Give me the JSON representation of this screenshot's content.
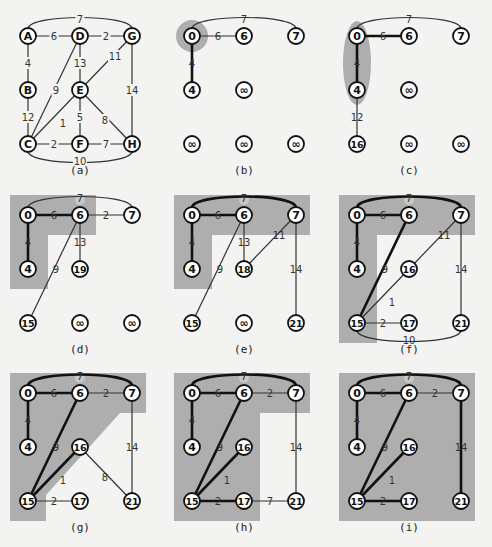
{
  "figure": {
    "background": "#f3f3f1",
    "shade_color": "#aeaeae",
    "edge_color": "#333333",
    "tree_edge_color": "#111111"
  },
  "chart_data": {
    "type": "graph",
    "source_node": "A",
    "nodes": [
      "A",
      "B",
      "C",
      "D",
      "E",
      "F",
      "G",
      "H"
    ],
    "edges": [
      {
        "u": "A",
        "v": "G",
        "w": 7
      },
      {
        "u": "A",
        "v": "D",
        "w": 6
      },
      {
        "u": "D",
        "v": "G",
        "w": 2
      },
      {
        "u": "A",
        "v": "B",
        "w": 4
      },
      {
        "u": "D",
        "v": "E",
        "w": 13
      },
      {
        "u": "G",
        "v": "E",
        "w": 11
      },
      {
        "u": "B",
        "v": "C",
        "w": 12
      },
      {
        "u": "D",
        "v": "C",
        "w": 9
      },
      {
        "u": "G",
        "v": "H",
        "w": 14
      },
      {
        "u": "E",
        "v": "C",
        "w": 1
      },
      {
        "u": "E",
        "v": "F",
        "w": 5
      },
      {
        "u": "E",
        "v": "H",
        "w": 8
      },
      {
        "u": "C",
        "v": "F",
        "w": 2
      },
      {
        "u": "F",
        "v": "H",
        "w": 7
      },
      {
        "u": "C",
        "v": "H",
        "w": 10
      }
    ],
    "panels": [
      {
        "label": "(a)",
        "type": "original",
        "dist": null
      },
      {
        "label": "(b)",
        "dist": {
          "A": "0",
          "B": "∞",
          "C": "∞",
          "D": "6",
          "E": "∞",
          "F": "∞",
          "G": "7",
          "H": "∞"
        }
      },
      {
        "label": "(c)",
        "dist": {
          "A": "0",
          "B": "4",
          "C": "16",
          "D": "6",
          "E": "∞",
          "F": "∞",
          "G": "7",
          "H": "∞"
        }
      },
      {
        "label": "(d)",
        "dist": {
          "A": "0",
          "B": "4",
          "C": "15",
          "D": "6",
          "E": "19",
          "F": "∞",
          "G": "7",
          "H": "∞"
        }
      },
      {
        "label": "(e)",
        "dist": {
          "A": "0",
          "B": "4",
          "C": "15",
          "D": "6",
          "E": "18",
          "F": "∞",
          "G": "7",
          "H": "21"
        }
      },
      {
        "label": "(f)",
        "dist": {
          "A": "0",
          "B": "4",
          "C": "15",
          "D": "6",
          "E": "16",
          "F": "17",
          "G": "7",
          "H": "21"
        }
      },
      {
        "label": "(g)",
        "dist": {
          "A": "0",
          "B": "4",
          "C": "15",
          "D": "6",
          "E": "16",
          "F": "17",
          "G": "7",
          "H": "21"
        }
      },
      {
        "label": "(h)",
        "dist": {
          "A": "0",
          "B": "4",
          "C": "15",
          "D": "6",
          "E": "16",
          "F": "17",
          "G": "7",
          "H": "21"
        }
      },
      {
        "label": "(i)",
        "dist": {
          "A": "0",
          "B": "4",
          "C": "15",
          "D": "6",
          "E": "16",
          "F": "17",
          "G": "7",
          "H": "21"
        }
      }
    ]
  },
  "panels": [
    {
      "label": "(a)",
      "nodes": {
        "A": "A",
        "B": "B",
        "C": "C",
        "D": "D",
        "E": "E",
        "F": "F",
        "G": "G",
        "H": "H"
      },
      "edges": [
        {
          "u": "A",
          "v": "G",
          "w": "7",
          "arc": "top",
          "style": "n"
        },
        {
          "u": "A",
          "v": "D",
          "w": "6",
          "style": "n"
        },
        {
          "u": "D",
          "v": "G",
          "w": "2",
          "style": "n"
        },
        {
          "u": "A",
          "v": "B",
          "w": "4",
          "style": "n"
        },
        {
          "u": "D",
          "v": "E",
          "w": "13",
          "style": "n"
        },
        {
          "u": "G",
          "v": "E",
          "w": "11",
          "style": "n"
        },
        {
          "u": "B",
          "v": "C",
          "w": "12",
          "style": "n"
        },
        {
          "u": "D",
          "v": "C",
          "w": "9",
          "style": "n"
        },
        {
          "u": "G",
          "v": "H",
          "w": "14",
          "style": "n"
        },
        {
          "u": "E",
          "v": "C",
          "w": "1",
          "style": "n"
        },
        {
          "u": "E",
          "v": "F",
          "w": "5",
          "style": "n"
        },
        {
          "u": "E",
          "v": "H",
          "w": "8",
          "style": "n"
        },
        {
          "u": "C",
          "v": "F",
          "w": "2",
          "style": "n"
        },
        {
          "u": "F",
          "v": "H",
          "w": "7",
          "style": "n"
        },
        {
          "u": "C",
          "v": "H",
          "w": "10",
          "arc": "bottom",
          "style": "n"
        }
      ],
      "shade": null
    },
    {
      "label": "(b)",
      "nodes": {
        "A": "0",
        "B": "4",
        "C": "∞",
        "D": "6",
        "E": "∞",
        "F": "∞",
        "G": "7",
        "H": "∞"
      },
      "edges": [
        {
          "u": "A",
          "v": "G",
          "w": "7",
          "arc": "top",
          "style": "n"
        },
        {
          "u": "A",
          "v": "D",
          "w": "6",
          "style": "n"
        },
        {
          "u": "A",
          "v": "B",
          "w": "4",
          "style": "b"
        }
      ],
      "shade": "circle"
    },
    {
      "label": "(c)",
      "nodes": {
        "A": "0",
        "B": "4",
        "C": "16",
        "D": "6",
        "E": "∞",
        "F": "∞",
        "G": "7",
        "H": "∞"
      },
      "edges": [
        {
          "u": "A",
          "v": "G",
          "w": "7",
          "arc": "top",
          "style": "n"
        },
        {
          "u": "A",
          "v": "D",
          "w": "6",
          "style": "b"
        },
        {
          "u": "A",
          "v": "B",
          "w": "4",
          "style": "b"
        },
        {
          "u": "B",
          "v": "C",
          "w": "12",
          "style": "n"
        }
      ],
      "shade": "ellipse"
    },
    {
      "label": "(d)",
      "nodes": {
        "A": "0",
        "B": "4",
        "C": "15",
        "D": "6",
        "E": "19",
        "F": "∞",
        "G": "7",
        "H": "∞"
      },
      "edges": [
        {
          "u": "A",
          "v": "G",
          "w": "7",
          "arc": "top",
          "style": "n"
        },
        {
          "u": "A",
          "v": "D",
          "w": "6",
          "style": "b"
        },
        {
          "u": "D",
          "v": "G",
          "w": "2",
          "style": "n"
        },
        {
          "u": "A",
          "v": "B",
          "w": "4",
          "style": "b"
        },
        {
          "u": "D",
          "v": "E",
          "w": "13",
          "style": "n"
        },
        {
          "u": "D",
          "v": "C",
          "w": "9",
          "style": "n"
        }
      ],
      "shade": "d"
    },
    {
      "label": "(e)",
      "nodes": {
        "A": "0",
        "B": "4",
        "C": "15",
        "D": "6",
        "E": "18",
        "F": "∞",
        "G": "7",
        "H": "21"
      },
      "edges": [
        {
          "u": "A",
          "v": "G",
          "w": "7",
          "arc": "top",
          "style": "b"
        },
        {
          "u": "A",
          "v": "D",
          "w": "6",
          "style": "b"
        },
        {
          "u": "A",
          "v": "B",
          "w": "4",
          "style": "b"
        },
        {
          "u": "D",
          "v": "E",
          "w": "13",
          "style": "n"
        },
        {
          "u": "G",
          "v": "E",
          "w": "11",
          "style": "n"
        },
        {
          "u": "D",
          "v": "C",
          "w": "9",
          "style": "n"
        },
        {
          "u": "G",
          "v": "H",
          "w": "14",
          "style": "n"
        }
      ],
      "shade": "e"
    },
    {
      "label": "(f)",
      "nodes": {
        "A": "0",
        "B": "4",
        "C": "15",
        "D": "6",
        "E": "16",
        "F": "17",
        "G": "7",
        "H": "21"
      },
      "edges": [
        {
          "u": "A",
          "v": "G",
          "w": "7",
          "arc": "top",
          "style": "b"
        },
        {
          "u": "A",
          "v": "D",
          "w": "6",
          "style": "b"
        },
        {
          "u": "A",
          "v": "B",
          "w": "4",
          "style": "b"
        },
        {
          "u": "G",
          "v": "E",
          "w": "11",
          "style": "n"
        },
        {
          "u": "D",
          "v": "C",
          "w": "9",
          "style": "b"
        },
        {
          "u": "G",
          "v": "H",
          "w": "14",
          "style": "n"
        },
        {
          "u": "E",
          "v": "C",
          "w": "1",
          "style": "n"
        },
        {
          "u": "C",
          "v": "F",
          "w": "2",
          "style": "n"
        },
        {
          "u": "C",
          "v": "H",
          "w": "10",
          "arc": "bottom",
          "style": "n"
        }
      ],
      "shade": "f"
    },
    {
      "label": "(g)",
      "nodes": {
        "A": "0",
        "B": "4",
        "C": "15",
        "D": "6",
        "E": "16",
        "F": "17",
        "G": "7",
        "H": "21"
      },
      "edges": [
        {
          "u": "A",
          "v": "G",
          "w": "7",
          "arc": "top",
          "style": "b"
        },
        {
          "u": "A",
          "v": "D",
          "w": "6",
          "style": "b"
        },
        {
          "u": "D",
          "v": "G",
          "w": "2",
          "style": "n"
        },
        {
          "u": "A",
          "v": "B",
          "w": "4",
          "style": "b"
        },
        {
          "u": "D",
          "v": "C",
          "w": "9",
          "style": "b"
        },
        {
          "u": "G",
          "v": "H",
          "w": "14",
          "style": "n"
        },
        {
          "u": "E",
          "v": "C",
          "w": "1",
          "style": "b"
        },
        {
          "u": "E",
          "v": "H",
          "w": "8",
          "style": "n"
        },
        {
          "u": "C",
          "v": "F",
          "w": "2",
          "style": "n"
        }
      ],
      "shade": "g"
    },
    {
      "label": "(h)",
      "nodes": {
        "A": "0",
        "B": "4",
        "C": "15",
        "D": "6",
        "E": "16",
        "F": "17",
        "G": "7",
        "H": "21"
      },
      "edges": [
        {
          "u": "A",
          "v": "G",
          "w": "7",
          "arc": "top",
          "style": "b"
        },
        {
          "u": "A",
          "v": "D",
          "w": "6",
          "style": "b"
        },
        {
          "u": "D",
          "v": "G",
          "w": "2",
          "style": "n"
        },
        {
          "u": "A",
          "v": "B",
          "w": "4",
          "style": "b"
        },
        {
          "u": "D",
          "v": "C",
          "w": "9",
          "style": "b"
        },
        {
          "u": "G",
          "v": "H",
          "w": "14",
          "style": "n"
        },
        {
          "u": "E",
          "v": "C",
          "w": "1",
          "style": "b"
        },
        {
          "u": "C",
          "v": "F",
          "w": "2",
          "style": "b"
        },
        {
          "u": "F",
          "v": "H",
          "w": "7",
          "style": "n"
        }
      ],
      "shade": "h"
    },
    {
      "label": "(i)",
      "nodes": {
        "A": "0",
        "B": "4",
        "C": "15",
        "D": "6",
        "E": "16",
        "F": "17",
        "G": "7",
        "H": "21"
      },
      "edges": [
        {
          "u": "A",
          "v": "G",
          "w": "7",
          "arc": "top",
          "style": "b"
        },
        {
          "u": "A",
          "v": "D",
          "w": "6",
          "style": "b"
        },
        {
          "u": "D",
          "v": "G",
          "w": "2",
          "style": "n"
        },
        {
          "u": "A",
          "v": "B",
          "w": "4",
          "style": "b"
        },
        {
          "u": "D",
          "v": "C",
          "w": "9",
          "style": "b"
        },
        {
          "u": "G",
          "v": "H",
          "w": "14",
          "style": "b"
        },
        {
          "u": "E",
          "v": "C",
          "w": "1",
          "style": "b"
        },
        {
          "u": "C",
          "v": "F",
          "w": "2",
          "style": "b"
        }
      ],
      "shade": "i"
    }
  ]
}
